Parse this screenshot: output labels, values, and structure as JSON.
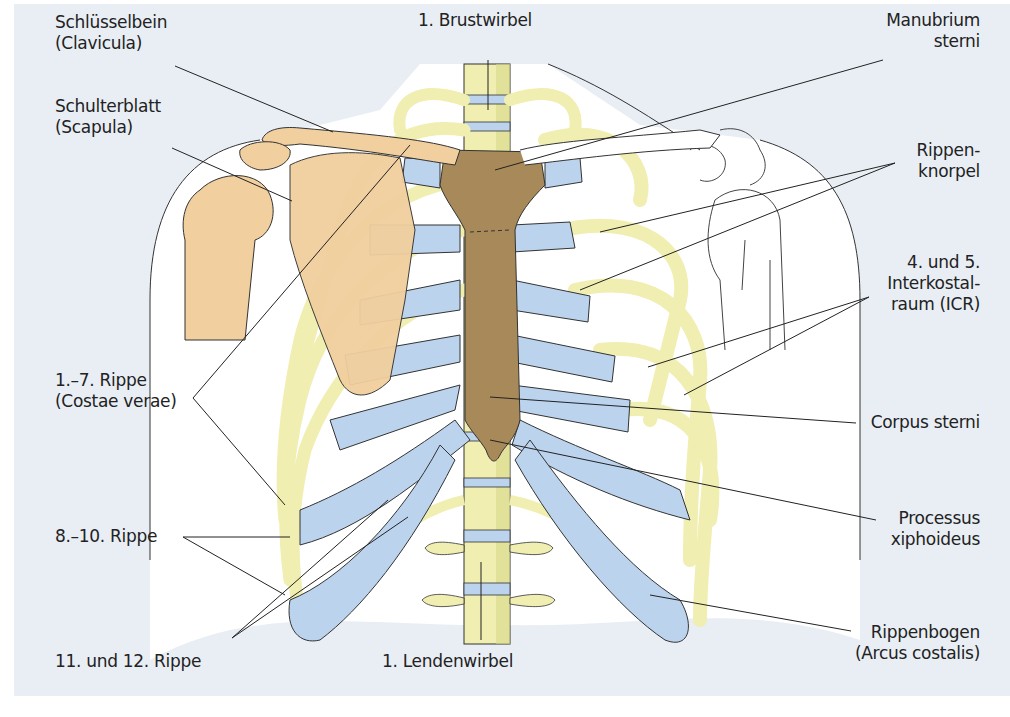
{
  "figure": {
    "colors": {
      "background": "#e9eef5",
      "body_outline_fill": "#ffffff",
      "bone": "#f0eeb0",
      "bone_shadow": "#d9d98a",
      "cartilage": "#bcd3ee",
      "sternum": "#a88a5a",
      "scapula_humerus": "#f1cf9e",
      "line": "#222222"
    }
  },
  "labels": {
    "clavicula": {
      "line1": "Schlüsselbein",
      "line2": "(Clavicula)"
    },
    "scapula": {
      "line1": "Schulterblatt",
      "line2": "(Scapula)"
    },
    "brustwirbel": {
      "line1": "1. Brustwirbel"
    },
    "manubrium": {
      "line1": "Manubrium",
      "line2": "sterni"
    },
    "rippenknorpel": {
      "line1": "Rippen-",
      "line2": "knorpel"
    },
    "icr": {
      "line1": "4. und 5.",
      "line2": "Interkostal-",
      "line3": "raum (ICR)"
    },
    "costae_verae": {
      "line1": "1.–7. Rippe",
      "line2": "(Costae verae)"
    },
    "corpus_sterni": {
      "line1": "Corpus sterni"
    },
    "rippe_8_10": {
      "line1": "8.–10. Rippe"
    },
    "processus": {
      "line1": "Processus",
      "line2": "xiphoideus"
    },
    "rippe_11_12": {
      "line1": "11. und 12. Rippe"
    },
    "lendenwirbel": {
      "line1": "1. Lendenwirbel"
    },
    "rippenbogen": {
      "line1": "Rippenbogen",
      "line2": "(Arcus costalis)"
    }
  }
}
